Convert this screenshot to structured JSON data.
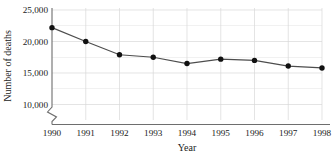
{
  "chart_data": {
    "type": "line",
    "title": "",
    "xlabel": "Year",
    "ylabel": "Number of deaths",
    "categories": [
      "1990",
      "1991",
      "1992",
      "1993",
      "1994",
      "1995",
      "1996",
      "1997",
      "1998"
    ],
    "x": [
      1990,
      1991,
      1992,
      1993,
      1994,
      1995,
      1996,
      1997,
      1998
    ],
    "series": [
      {
        "name": "Number of deaths",
        "values": [
          22200,
          20000,
          17900,
          17500,
          16500,
          17200,
          17000,
          16100,
          15800
        ]
      }
    ],
    "ylim": [
      8750,
      25800
    ],
    "ytick_values": [
      10000,
      15000,
      20000,
      25000
    ],
    "ytick_labels": [
      "10,000",
      "15,000",
      "20,000",
      "25,000"
    ],
    "yminor_values": [
      12500,
      17500,
      22500
    ],
    "xtick_labels": [
      "1990",
      "1991",
      "1992",
      "1993",
      "1994",
      "1995",
      "1996",
      "1997",
      "1998"
    ],
    "grid": true,
    "grid_axis": "both",
    "legend": false,
    "legend_position": "none",
    "axis_break": true,
    "axis_break_note": "zigzag break on y-axis below 10,000",
    "marker": "filled-circle",
    "line_color": "#4d4d4d",
    "marker_color": "#111111",
    "grid_color": "#d8d8d8",
    "axis_color": "#6e6e6e",
    "background_color": "#ffffff"
  },
  "labels": {
    "y_axis_title": "Number of deaths",
    "x_axis_title": "Year"
  }
}
